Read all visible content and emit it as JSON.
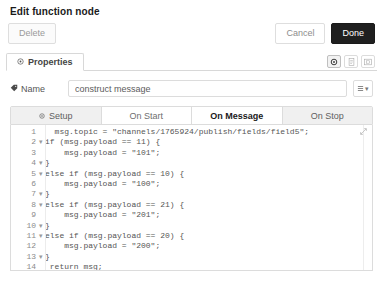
{
  "dialog": {
    "title": "Edit function node"
  },
  "buttons": {
    "delete_label": "Delete",
    "cancel_label": "Cancel",
    "done_label": "Done"
  },
  "properties_tab": {
    "label": "Properties",
    "tools": [
      {
        "name": "gear-icon",
        "title": "Properties",
        "active": true
      },
      {
        "name": "description-icon",
        "title": "Description",
        "active": false
      },
      {
        "name": "appearance-icon",
        "title": "Appearance",
        "active": false
      }
    ]
  },
  "name_row": {
    "label": "Name",
    "value": "construct message",
    "placeholder": "Name",
    "menu_caret": "▾"
  },
  "code_tabs": [
    {
      "label": "Setup",
      "icon": "gear-icon",
      "style": "grey"
    },
    {
      "label": "On Start",
      "icon": "",
      "style": "plain"
    },
    {
      "label": "On Message",
      "icon": "",
      "style": "active"
    },
    {
      "label": "On Stop",
      "icon": "",
      "style": "grey"
    }
  ],
  "editor": {
    "expand_icon": "expand-icon",
    "lines": [
      {
        "num": "1",
        "fold": "",
        "text": "  msg.topic = \"channels/1765924/publish/fields/field5\";"
      },
      {
        "num": "2",
        "fold": "▾",
        "text": "if (msg.payload == 11) {"
      },
      {
        "num": "3",
        "fold": "",
        "text": "    msg.payload = \"101\";"
      },
      {
        "num": "4",
        "fold": "▾",
        "text": "}"
      },
      {
        "num": "5",
        "fold": "▾",
        "text": "else if (msg.payload == 10) {"
      },
      {
        "num": "6",
        "fold": "",
        "text": "    msg.payload = \"100\";"
      },
      {
        "num": "7",
        "fold": "▾",
        "text": "}"
      },
      {
        "num": "8",
        "fold": "▾",
        "text": "else if (msg.payload == 21) {"
      },
      {
        "num": "9",
        "fold": "",
        "text": "    msg.payload = \"201\";"
      },
      {
        "num": "10",
        "fold": "▾",
        "text": "}"
      },
      {
        "num": "11",
        "fold": "▾",
        "text": "else if (msg.payload == 20) {"
      },
      {
        "num": "12",
        "fold": "",
        "text": "    msg.payload = \"200\";"
      },
      {
        "num": "13",
        "fold": "▾",
        "text": "}"
      },
      {
        "num": "14",
        "fold": "",
        "text": " return msg;"
      }
    ]
  }
}
